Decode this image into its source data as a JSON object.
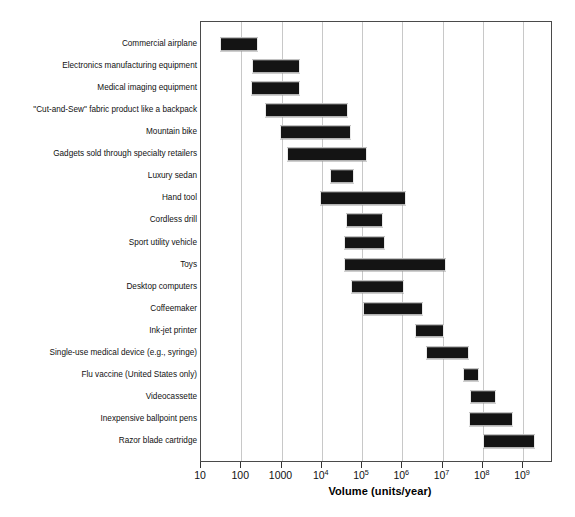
{
  "chart_data": {
    "type": "bar",
    "orientation": "horizontal",
    "subtype": "range-bar",
    "title": "",
    "xlabel": "Volume (units/year)",
    "ylabel": "",
    "xscale": "log",
    "xlim": [
      10,
      4000000000
    ],
    "grid": true,
    "legend": false,
    "xticks": [
      10,
      100,
      1000,
      10000,
      100000,
      1000000,
      10000000,
      100000000,
      1000000000
    ],
    "xticklabels": [
      "10",
      "100",
      "1000",
      "10⁴",
      "10⁵",
      "10⁶",
      "10⁷",
      "10⁸",
      "10⁹"
    ],
    "xtick_mantissas": [
      "10",
      "100",
      "1000",
      "10",
      "10",
      "10",
      "10",
      "10",
      "10"
    ],
    "xtick_exponents": [
      "",
      "",
      "",
      "4",
      "5",
      "6",
      "7",
      "8",
      "9"
    ],
    "categories": [
      "Commercial airplane",
      "Electronics manufacturing equipment",
      "Medical imaging equipment",
      "\"Cut-and-Sew\" fabric product like a backpack",
      "Mountain bike",
      "Gadgets sold through specialty retailers",
      "Luxury sedan",
      "Hand tool",
      "Cordless drill",
      "Sport utility vehicle",
      "Toys",
      "Desktop computers",
      "Coffeemaker",
      "Ink-jet printer",
      "Single-use medical device (e.g., syringe)",
      "Flu vaccine (United States only)",
      "Videocassette",
      "Inexpensive ballpoint pens",
      "Razor blade cartridge"
    ],
    "ranges": [
      {
        "category": "Commercial airplane",
        "low": 30,
        "high": 230
      },
      {
        "category": "Electronics manufacturing equipment",
        "low": 185,
        "high": 2500
      },
      {
        "category": "Medical imaging equipment",
        "low": 170,
        "high": 2600
      },
      {
        "category": "\"Cut-and-Sew\" fabric product like a backpack",
        "low": 400,
        "high": 40000
      },
      {
        "category": "Mountain bike",
        "low": 900,
        "high": 47000
      },
      {
        "category": "Gadgets sold through specialty retailers",
        "low": 1400,
        "high": 120000
      },
      {
        "category": "Luxury sedan",
        "low": 16000,
        "high": 58000
      },
      {
        "category": "Hand tool",
        "low": 9000,
        "high": 1100000
      },
      {
        "category": "Cordless drill",
        "low": 40000,
        "high": 300000
      },
      {
        "category": "Sport utility vehicle",
        "low": 36000,
        "high": 340000
      },
      {
        "category": "Toys",
        "low": 36000,
        "high": 11000000
      },
      {
        "category": "Desktop computers",
        "low": 53000,
        "high": 1000000
      },
      {
        "category": "Coffeemaker",
        "low": 105000,
        "high": 3000000
      },
      {
        "category": "Ink-jet printer",
        "low": 2100000,
        "high": 10000000
      },
      {
        "category": "Single-use medical device (e.g., syringe)",
        "low": 4000000,
        "high": 40000000
      },
      {
        "category": "Flu vaccine (United States only)",
        "low": 33000000,
        "high": 70000000
      },
      {
        "category": "Videocassette",
        "low": 48000000,
        "high": 190000000
      },
      {
        "category": "Inexpensive ballpoint pens",
        "low": 45000000,
        "high": 500000000
      },
      {
        "category": "Razor blade cartridge",
        "low": 100000000,
        "high": 1800000000
      }
    ],
    "colors": {
      "bar": "#141414",
      "gridline": "#c8c8c8",
      "frame": "#4a4a4a",
      "text": "#111111",
      "background": "#ffffff"
    }
  }
}
